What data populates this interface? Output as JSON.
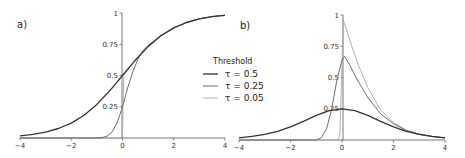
{
  "chart_data": [
    {
      "panel": "a)",
      "type": "line",
      "title": "",
      "xlabel": "",
      "ylabel": "",
      "xlim": [
        -4,
        4
      ],
      "ylim": [
        0,
        1
      ],
      "xticks": [
        -4,
        -2,
        0,
        2,
        4
      ],
      "xtick_labels": [
        "−4",
        "−2",
        "0",
        "2",
        "4"
      ],
      "yticks": [
        0.25,
        0.5,
        0.75,
        1
      ],
      "ytick_labels": [
        "0.25",
        "0.5",
        "0.75",
        "1"
      ],
      "grid": false,
      "series": [
        {
          "name": "τ = 0.5",
          "color": "#333333",
          "width": 1.3,
          "x": [
            -4,
            -3.5,
            -3,
            -2.5,
            -2,
            -1.5,
            -1,
            -0.5,
            0,
            0.5,
            1,
            1.5,
            2,
            2.5,
            3,
            3.5,
            4
          ],
          "y": [
            0.018,
            0.029,
            0.047,
            0.076,
            0.119,
            0.182,
            0.269,
            0.378,
            0.5,
            0.622,
            0.731,
            0.818,
            0.881,
            0.924,
            0.953,
            0.971,
            0.982
          ]
        },
        {
          "name": "τ = 0.25",
          "color": "#6e6e6e",
          "width": 1.0,
          "x": [
            -4,
            -1,
            -0.8,
            -0.6,
            -0.4,
            -0.2,
            0,
            0.2,
            0.4,
            0.6,
            0.8,
            1,
            1.5,
            2,
            2.5,
            3,
            3.5,
            4
          ],
          "y": [
            0,
            0,
            0.003,
            0.015,
            0.05,
            0.13,
            0.25,
            0.4,
            0.53,
            0.63,
            0.7,
            0.74,
            0.82,
            0.882,
            0.925,
            0.954,
            0.972,
            0.983
          ]
        },
        {
          "name": "τ = 0.05",
          "color": "#a8a8a8",
          "width": 0.9,
          "x": [
            -4,
            -0.05,
            0,
            0.05,
            0.2,
            0.4,
            0.6,
            0.8,
            1,
            1.5,
            2,
            2.5,
            3,
            3.5,
            4
          ],
          "y": [
            0,
            0,
            0.05,
            0.5,
            0.55,
            0.6,
            0.65,
            0.69,
            0.73,
            0.818,
            0.881,
            0.924,
            0.953,
            0.971,
            0.982
          ]
        }
      ]
    },
    {
      "panel": "b)",
      "type": "line",
      "title": "",
      "xlabel": "",
      "ylabel": "",
      "xlim": [
        -4,
        4
      ],
      "ylim": [
        0,
        1
      ],
      "xticks": [
        -4,
        -2,
        0,
        2,
        4
      ],
      "xtick_labels": [
        "−4",
        "−2",
        "0",
        "2",
        "4"
      ],
      "yticks": [
        0.25,
        0.5,
        0.75,
        1
      ],
      "ytick_labels": [
        "0.25",
        "0.5",
        "0.75",
        "1"
      ],
      "grid": false,
      "series": [
        {
          "name": "τ = 0.5",
          "color": "#333333",
          "width": 1.3,
          "x": [
            -4,
            -3.5,
            -3,
            -2.5,
            -2,
            -1.5,
            -1,
            -0.5,
            0,
            0.5,
            1,
            1.5,
            2,
            2.5,
            3,
            3.5,
            4
          ],
          "y": [
            0.018,
            0.029,
            0.045,
            0.07,
            0.105,
            0.149,
            0.197,
            0.235,
            0.25,
            0.235,
            0.197,
            0.149,
            0.105,
            0.07,
            0.045,
            0.029,
            0.018
          ]
        },
        {
          "name": "τ = 0.25",
          "color": "#6e6e6e",
          "width": 1.0,
          "x": [
            -4,
            -1,
            -0.8,
            -0.6,
            -0.4,
            -0.2,
            0,
            0.1,
            0.3,
            0.6,
            1,
            1.5,
            2,
            2.5,
            3,
            3.5,
            4
          ],
          "y": [
            0,
            0,
            0.02,
            0.09,
            0.25,
            0.48,
            0.64,
            0.67,
            0.6,
            0.48,
            0.34,
            0.21,
            0.13,
            0.075,
            0.045,
            0.028,
            0.017
          ]
        },
        {
          "name": "τ = 0.05",
          "color": "#a8a8a8",
          "width": 0.9,
          "x": [
            -4,
            -0.15,
            -0.08,
            0,
            0.04,
            0.1,
            0.3,
            0.6,
            1,
            1.5,
            2,
            2.5,
            3,
            3.5,
            4
          ],
          "y": [
            0,
            0,
            0.05,
            0.6,
            0.97,
            0.93,
            0.8,
            0.62,
            0.42,
            0.24,
            0.14,
            0.08,
            0.048,
            0.029,
            0.018
          ]
        }
      ]
    }
  ],
  "legend": {
    "title": "Threshold",
    "entries": [
      {
        "label": "τ = 0.5",
        "color": "#333333"
      },
      {
        "label": "τ = 0.25",
        "color": "#6e6e6e"
      },
      {
        "label": "τ = 0.05",
        "color": "#a8a8a8"
      }
    ]
  },
  "panels": {
    "a_label": "a)",
    "b_label": "b)"
  }
}
